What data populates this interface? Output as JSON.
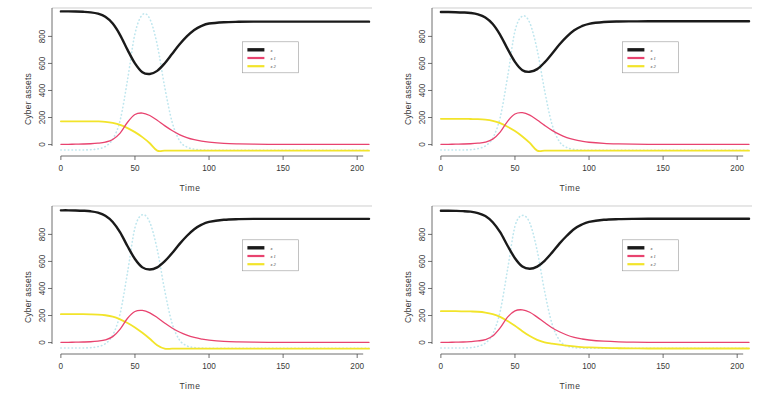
{
  "figure": {
    "kind": "multi-panel-line-chart",
    "panel_count": 4,
    "layout": "2x2 grid",
    "background_color": "#ffffff"
  },
  "colors": {
    "series_black": "#1a1a1a",
    "series_pink": "#e8436f",
    "series_yellow": "#f2e42a",
    "series_cyan": "#bfe6ee",
    "axis": "#4a4a4a",
    "text": "#3a3a3a",
    "legend_border": "#9a9a9a"
  },
  "axes": {
    "xlabel": "Time",
    "ylabel": "Cyber assets",
    "xticks": [
      "0",
      "50",
      "100",
      "150",
      "200"
    ],
    "xtick_values": [
      0,
      50,
      100,
      150,
      200
    ],
    "yticks": [
      "0",
      "200",
      "400",
      "600",
      "800"
    ],
    "ytick_values": [
      0,
      200,
      400,
      600,
      800
    ],
    "xlim": [
      -6,
      210
    ],
    "ylim": [
      -55,
      1010
    ],
    "grid": "off"
  },
  "legend": {
    "position": "center-right inside plot",
    "border": true,
    "entries": [
      {
        "label": "x",
        "color_key": "series_black",
        "style": "solid",
        "width": "thick"
      },
      {
        "label": "x 1",
        "color_key": "series_pink",
        "style": "solid",
        "width": "thin"
      },
      {
        "label": "x 2",
        "color_key": "series_yellow",
        "style": "solid",
        "width": "thin"
      }
    ]
  },
  "chart_data": [
    {
      "type": "line",
      "id": "panel-top-left",
      "title": "",
      "xlabel": "Time",
      "ylabel": "Cyber assets",
      "xlim": [
        -6,
        210
      ],
      "ylim": [
        -55,
        1010
      ],
      "xticks": [
        0,
        50,
        100,
        150,
        200
      ],
      "yticks": [
        0,
        200,
        400,
        600,
        800
      ],
      "grid": false,
      "legend": [
        "x",
        "x 1",
        "x 2"
      ],
      "x": [
        0,
        5,
        10,
        15,
        20,
        25,
        30,
        35,
        40,
        45,
        50,
        55,
        60,
        65,
        70,
        75,
        80,
        85,
        90,
        95,
        100,
        110,
        120,
        130,
        140,
        150,
        160,
        170,
        180,
        190,
        200,
        208
      ],
      "series": [
        {
          "name": "x",
          "color": "#1a1a1a",
          "style": "solid",
          "width": 2.4,
          "values": [
            985,
            985,
            984,
            982,
            978,
            968,
            945,
            895,
            810,
            700,
            600,
            535,
            522,
            545,
            600,
            670,
            740,
            800,
            848,
            878,
            895,
            905,
            908,
            909,
            909,
            909,
            909,
            909,
            909,
            909,
            909,
            909
          ]
        },
        {
          "name": "x 1",
          "color": "#e8436f",
          "style": "solid",
          "width": 1.3,
          "values": [
            2,
            2,
            3,
            4,
            6,
            10,
            18,
            38,
            85,
            165,
            222,
            233,
            215,
            180,
            140,
            104,
            74,
            52,
            36,
            25,
            18,
            9,
            5,
            3,
            2,
            2,
            2,
            2,
            2,
            2,
            2,
            2
          ]
        },
        {
          "name": "x 2",
          "color": "#f2e42a",
          "style": "solid",
          "width": 1.8,
          "values": [
            172,
            172,
            172,
            172,
            172,
            171,
            168,
            160,
            146,
            122,
            92,
            55,
            10,
            -45,
            -45,
            -45,
            -45,
            -45,
            -45,
            -45,
            -45,
            -45,
            -45,
            -45,
            -45,
            -45,
            -45,
            -45,
            -45,
            -45,
            -45,
            -45
          ]
        },
        {
          "name": "x 3",
          "color": "#bfe6ee",
          "style": "dotted",
          "width": 1.6,
          "values": [
            -40,
            -40,
            -40,
            -40,
            -38,
            -32,
            -14,
            40,
            180,
            480,
            820,
            960,
            930,
            740,
            430,
            170,
            30,
            -18,
            -34,
            -40,
            -42,
            -42,
            -42,
            -42,
            -42,
            -42,
            -42,
            -42,
            -42,
            -42,
            -42,
            -42
          ]
        }
      ]
    },
    {
      "type": "line",
      "id": "panel-top-right",
      "title": "",
      "xlabel": "Time",
      "ylabel": "Cyber assets",
      "xlim": [
        -6,
        210
      ],
      "ylim": [
        -55,
        1010
      ],
      "xticks": [
        0,
        50,
        100,
        150,
        200
      ],
      "yticks": [
        0,
        200,
        400,
        600,
        800
      ],
      "grid": false,
      "legend": [
        "x",
        "x 1",
        "x 2"
      ],
      "x": [
        0,
        5,
        10,
        15,
        20,
        25,
        30,
        35,
        40,
        45,
        50,
        55,
        60,
        65,
        70,
        75,
        80,
        85,
        90,
        95,
        100,
        110,
        120,
        130,
        140,
        150,
        160,
        170,
        180,
        190,
        200,
        208
      ],
      "series": [
        {
          "name": "x",
          "color": "#1a1a1a",
          "style": "solid",
          "width": 2.4,
          "values": [
            980,
            980,
            979,
            977,
            973,
            963,
            940,
            892,
            812,
            708,
            612,
            550,
            538,
            558,
            608,
            672,
            740,
            798,
            845,
            875,
            893,
            906,
            910,
            911,
            912,
            912,
            912,
            912,
            912,
            912,
            912,
            912
          ]
        },
        {
          "name": "x 1",
          "color": "#e8436f",
          "style": "solid",
          "width": 1.3,
          "values": [
            2,
            2,
            3,
            4,
            6,
            10,
            18,
            40,
            92,
            172,
            226,
            236,
            218,
            182,
            142,
            105,
            75,
            52,
            36,
            25,
            17,
            9,
            5,
            3,
            2,
            2,
            2,
            2,
            2,
            2,
            2,
            2
          ]
        },
        {
          "name": "x 2",
          "color": "#f2e42a",
          "style": "solid",
          "width": 1.8,
          "values": [
            190,
            190,
            190,
            190,
            189,
            188,
            184,
            175,
            158,
            132,
            100,
            60,
            12,
            -45,
            -45,
            -45,
            -45,
            -45,
            -45,
            -45,
            -45,
            -45,
            -45,
            -45,
            -45,
            -45,
            -45,
            -45,
            -45,
            -45,
            -45,
            -45
          ]
        },
        {
          "name": "x 3",
          "color": "#bfe6ee",
          "style": "dotted",
          "width": 1.6,
          "values": [
            -40,
            -40,
            -40,
            -40,
            -38,
            -30,
            -10,
            48,
            200,
            500,
            840,
            950,
            900,
            700,
            400,
            150,
            22,
            -22,
            -36,
            -41,
            -42,
            -42,
            -42,
            -42,
            -42,
            -42,
            -42,
            -42,
            -42,
            -42,
            -42,
            -42
          ]
        }
      ]
    },
    {
      "type": "line",
      "id": "panel-bottom-left",
      "title": "",
      "xlabel": "Time",
      "ylabel": "Cyber assets",
      "xlim": [
        -6,
        210
      ],
      "ylim": [
        -55,
        1010
      ],
      "xticks": [
        0,
        50,
        100,
        150,
        200
      ],
      "yticks": [
        0,
        200,
        400,
        600,
        800
      ],
      "grid": false,
      "legend": [
        "x",
        "x 1",
        "x 2"
      ],
      "x": [
        0,
        5,
        10,
        15,
        20,
        25,
        30,
        35,
        40,
        45,
        50,
        55,
        60,
        65,
        70,
        75,
        80,
        85,
        90,
        95,
        100,
        110,
        120,
        130,
        140,
        150,
        160,
        170,
        180,
        190,
        200,
        208
      ],
      "series": [
        {
          "name": "x",
          "color": "#1a1a1a",
          "style": "solid",
          "width": 2.4,
          "values": [
            978,
            978,
            977,
            975,
            971,
            961,
            938,
            892,
            815,
            712,
            618,
            556,
            540,
            556,
            600,
            660,
            728,
            788,
            838,
            872,
            892,
            908,
            913,
            915,
            915,
            915,
            915,
            915,
            915,
            915,
            915,
            915
          ]
        },
        {
          "name": "x 1",
          "color": "#e8436f",
          "style": "solid",
          "width": 1.3,
          "values": [
            2,
            2,
            3,
            4,
            6,
            11,
            20,
            44,
            100,
            180,
            230,
            238,
            220,
            185,
            145,
            108,
            78,
            55,
            38,
            26,
            18,
            9,
            5,
            3,
            2,
            2,
            2,
            2,
            2,
            2,
            2,
            2
          ]
        },
        {
          "name": "x 2",
          "color": "#f2e42a",
          "style": "solid",
          "width": 1.8,
          "values": [
            210,
            210,
            210,
            210,
            209,
            207,
            202,
            192,
            172,
            145,
            112,
            72,
            28,
            -20,
            -45,
            -45,
            -45,
            -45,
            -45,
            -45,
            -45,
            -45,
            -45,
            -45,
            -45,
            -45,
            -45,
            -45,
            -45,
            -45,
            -45,
            -45
          ]
        },
        {
          "name": "x 3",
          "color": "#bfe6ee",
          "style": "dotted",
          "width": 1.6,
          "values": [
            -40,
            -40,
            -40,
            -40,
            -38,
            -30,
            -8,
            55,
            215,
            520,
            850,
            945,
            890,
            690,
            390,
            145,
            20,
            -24,
            -37,
            -41,
            -42,
            -42,
            -42,
            -42,
            -42,
            -42,
            -42,
            -42,
            -42,
            -42,
            -42,
            -42
          ]
        }
      ]
    },
    {
      "type": "line",
      "id": "panel-bottom-right",
      "title": "",
      "xlabel": "Time",
      "ylabel": "Cyber assets",
      "xlim": [
        -6,
        210
      ],
      "ylim": [
        -55,
        1010
      ],
      "xticks": [
        0,
        50,
        100,
        150,
        200
      ],
      "yticks": [
        0,
        200,
        400,
        600,
        800
      ],
      "grid": false,
      "legend": [
        "x",
        "x 1",
        "x 2"
      ],
      "x": [
        0,
        5,
        10,
        15,
        20,
        25,
        30,
        35,
        40,
        45,
        50,
        55,
        60,
        65,
        70,
        75,
        80,
        85,
        90,
        95,
        100,
        110,
        120,
        130,
        140,
        150,
        160,
        170,
        180,
        190,
        200,
        208
      ],
      "series": [
        {
          "name": "x",
          "color": "#1a1a1a",
          "style": "solid",
          "width": 2.4,
          "values": [
            975,
            975,
            974,
            972,
            968,
            958,
            936,
            890,
            816,
            716,
            624,
            562,
            546,
            562,
            605,
            665,
            732,
            790,
            840,
            872,
            892,
            908,
            913,
            915,
            916,
            916,
            916,
            916,
            916,
            916,
            916,
            916
          ]
        },
        {
          "name": "x 1",
          "color": "#e8436f",
          "style": "solid",
          "width": 1.3,
          "values": [
            2,
            2,
            3,
            4,
            7,
            12,
            22,
            48,
            108,
            188,
            234,
            242,
            224,
            188,
            148,
            110,
            80,
            56,
            39,
            27,
            19,
            10,
            5,
            3,
            2,
            2,
            2,
            2,
            2,
            2,
            2,
            2
          ]
        },
        {
          "name": "x 2",
          "color": "#f2e42a",
          "style": "solid",
          "width": 1.8,
          "values": [
            232,
            232,
            232,
            231,
            230,
            228,
            222,
            210,
            190,
            160,
            124,
            84,
            48,
            20,
            2,
            -8,
            -16,
            -22,
            -28,
            -33,
            -36,
            -40,
            -42,
            -43,
            -44,
            -44,
            -44,
            -44,
            -44,
            -44,
            -44,
            -44
          ]
        },
        {
          "name": "x 3",
          "color": "#bfe6ee",
          "style": "dotted",
          "width": 1.6,
          "values": [
            -40,
            -40,
            -40,
            -40,
            -38,
            -28,
            -4,
            62,
            230,
            540,
            860,
            940,
            885,
            680,
            380,
            140,
            18,
            -25,
            -38,
            -41,
            -42,
            -42,
            -42,
            -42,
            -42,
            -42,
            -42,
            -42,
            -42,
            -42,
            -42,
            -42
          ]
        }
      ]
    }
  ]
}
